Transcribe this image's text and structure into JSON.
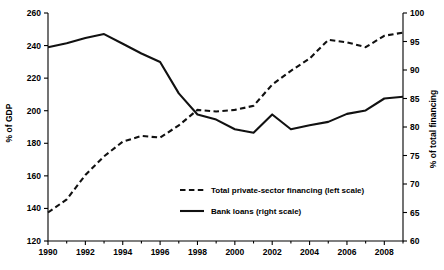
{
  "chart_data": {
    "type": "line",
    "title": "",
    "subtitle": "",
    "xlabel": "",
    "ylabel": "% of GDP",
    "ylabel_right": "% of total financing",
    "grid": false,
    "legend_position": "center",
    "x": [
      1990,
      1991,
      1992,
      1993,
      1994,
      1995,
      1996,
      1997,
      1998,
      1999,
      2000,
      2001,
      2002,
      2003,
      2004,
      2005,
      2006,
      2007,
      2008,
      2009
    ],
    "xlim": [
      1990,
      2009
    ],
    "xticks": [
      1990,
      1992,
      1994,
      1996,
      1998,
      2000,
      2002,
      2004,
      2006,
      2008
    ],
    "xticklabels": [
      "1990",
      "1992",
      "1994",
      "1996",
      "1998",
      "2000",
      "2002",
      "2004",
      "2006",
      "2008"
    ],
    "xminorticks": [
      1991,
      1993,
      1995,
      1997,
      1999,
      2001,
      2003,
      2005,
      2007,
      2009
    ],
    "ylim": [
      120,
      260
    ],
    "yticks": [
      120,
      140,
      160,
      180,
      200,
      220,
      240,
      260
    ],
    "yticklabels": [
      "120",
      "140",
      "160",
      "180",
      "200",
      "220",
      "240",
      "260"
    ],
    "ylim_right": [
      60,
      100
    ],
    "yticks_right": [
      60,
      65,
      70,
      75,
      80,
      85,
      90,
      95,
      100
    ],
    "yticklabels_right": [
      "60",
      "65",
      "70",
      "75",
      "80",
      "85",
      "90",
      "95",
      "100"
    ],
    "series": [
      {
        "name": "Total private-sector financing (left scale)",
        "axis": "left",
        "style": "dashed",
        "unit": "% of GDP",
        "values": [
          137.5,
          145.5,
          160.5,
          172.0,
          181.0,
          184.5,
          183.5,
          191.0,
          200.5,
          199.5,
          200.5,
          203.0,
          216.0,
          224.5,
          232.0,
          243.5,
          242.0,
          239.0,
          246.0,
          248.0
        ]
      },
      {
        "name": "Bank loans (right scale)",
        "axis": "right",
        "style": "solid",
        "unit": "% of total financing",
        "values": [
          94.0,
          94.7,
          95.6,
          96.3,
          94.6,
          92.9,
          91.4,
          85.9,
          82.2,
          81.3,
          79.6,
          79.0,
          82.2,
          79.6,
          80.3,
          80.9,
          82.3,
          82.9,
          85.0,
          85.3
        ]
      }
    ],
    "legend": [
      {
        "label": "Total private-sector financing (left scale)",
        "style": "dashed"
      },
      {
        "label": "Bank loans (right scale)",
        "style": "solid"
      }
    ]
  }
}
